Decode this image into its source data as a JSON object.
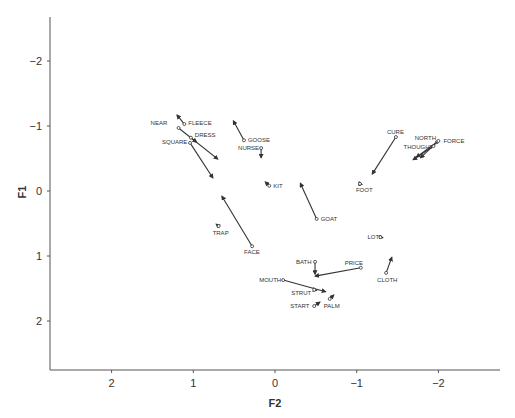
{
  "chart_data": {
    "type": "scatter",
    "subtype": "arrow-vector-plot",
    "title": "",
    "xlabel": "F2",
    "ylabel": "F1",
    "xlim": [
      2.75,
      -2.75
    ],
    "ylim": [
      -2.7,
      2.75
    ],
    "x_reversed": true,
    "y_reversed": true,
    "xticks": [
      2,
      1,
      0,
      -1,
      -2
    ],
    "yticks": [
      -2,
      -1,
      0,
      1,
      2
    ],
    "grid": false,
    "legend": null,
    "series": [
      {
        "name": "FLEECE",
        "start": [
          1.11,
          -1.03
        ],
        "end": [
          1.2,
          -1.17
        ],
        "label_dx": 4,
        "label_dy": 1,
        "anchor": "start"
      },
      {
        "name": "NEAR",
        "start": [
          1.18,
          -0.97
        ],
        "end": [
          0.7,
          -0.49
        ],
        "label_dx": -28,
        "label_dy": -3,
        "anchor": "start"
      },
      {
        "name": "DRESS",
        "start": [
          1.03,
          -0.82
        ],
        "end": [
          0.96,
          -0.75
        ],
        "label_dx": 4,
        "label_dy": -1,
        "anchor": "start"
      },
      {
        "name": "SQUARE",
        "start": [
          1.04,
          -0.74
        ],
        "end": [
          0.76,
          -0.2
        ],
        "label_dx": -28,
        "label_dy": 1,
        "anchor": "start"
      },
      {
        "name": "GOOSE",
        "start": [
          0.38,
          -0.78
        ],
        "end": [
          0.51,
          -1.08
        ],
        "label_dx": 4,
        "label_dy": 2,
        "anchor": "start"
      },
      {
        "name": "NURSE",
        "start": [
          0.17,
          -0.66
        ],
        "end": [
          0.17,
          -0.51
        ],
        "label_dx": -23,
        "label_dy": 2,
        "anchor": "start"
      },
      {
        "name": "KIT",
        "start": [
          0.07,
          -0.08
        ],
        "end": [
          0.12,
          -0.14
        ],
        "label_dx": 4,
        "label_dy": 2,
        "anchor": "start"
      },
      {
        "name": "GOAT",
        "start": [
          -0.51,
          0.43
        ],
        "end": [
          -0.31,
          -0.12
        ],
        "label_dx": 4,
        "label_dy": 2,
        "anchor": "start"
      },
      {
        "name": "FOOT",
        "start": [
          -1.04,
          -0.11
        ],
        "end": [
          -1.03,
          -0.14
        ],
        "label_dx": -4,
        "label_dy": 8,
        "anchor": "start"
      },
      {
        "name": "CURE",
        "start": [
          -1.48,
          -0.83
        ],
        "end": [
          -1.19,
          -0.26
        ],
        "label_dx": -9,
        "label_dy": -3,
        "anchor": "start"
      },
      {
        "name": "NORTH",
        "start": [
          -1.98,
          -0.75
        ],
        "end": [
          -1.73,
          -0.52
        ],
        "label_dx": -22,
        "label_dy": -2,
        "anchor": "start"
      },
      {
        "name": "FORCE",
        "start": [
          -2.0,
          -0.77
        ],
        "end": [
          -1.78,
          -0.51
        ],
        "label_dx": 5,
        "label_dy": 2,
        "anchor": "start"
      },
      {
        "name": "THOUGHT",
        "start": [
          -1.94,
          -0.69
        ],
        "end": [
          -1.69,
          -0.48
        ],
        "label_dx": -30,
        "label_dy": 3,
        "anchor": "start"
      },
      {
        "name": "TRAP",
        "start": [
          0.69,
          0.54
        ],
        "end": [
          0.72,
          0.51
        ],
        "label_dx": -6,
        "label_dy": 9,
        "anchor": "start"
      },
      {
        "name": "FACE",
        "start": [
          0.28,
          0.85
        ],
        "end": [
          0.65,
          0.08
        ],
        "label_dx": -8,
        "label_dy": 8,
        "anchor": "start"
      },
      {
        "name": "LOT",
        "start": [
          -1.29,
          0.71
        ],
        "end": [
          -1.32,
          0.72
        ],
        "label_dx": -13,
        "label_dy": 2,
        "anchor": "start"
      },
      {
        "name": "CLOTH",
        "start": [
          -1.36,
          1.26
        ],
        "end": [
          -1.43,
          1.02
        ],
        "label_dx": -9,
        "label_dy": 9,
        "anchor": "start"
      },
      {
        "name": "BATH",
        "start": [
          -0.49,
          1.09
        ],
        "end": [
          -0.49,
          1.28
        ],
        "label_dx": -19,
        "label_dy": 2,
        "anchor": "start"
      },
      {
        "name": "PRICE",
        "start": [
          -1.05,
          1.18
        ],
        "end": [
          -0.49,
          1.31
        ],
        "label_dx": -16,
        "label_dy": -3,
        "anchor": "start"
      },
      {
        "name": "MOUTH",
        "start": [
          -0.1,
          1.37
        ],
        "end": [
          -0.62,
          1.55
        ],
        "label_dx": -24,
        "label_dy": 2,
        "anchor": "start"
      },
      {
        "name": "STRUT",
        "start": [
          -0.48,
          1.52
        ],
        "end": [
          -0.51,
          1.53
        ],
        "label_dx": -23,
        "label_dy": 5,
        "anchor": "start"
      },
      {
        "name": "START",
        "start": [
          -0.48,
          1.77
        ],
        "end": [
          -0.55,
          1.71
        ],
        "label_dx": -24,
        "label_dy": 2,
        "anchor": "start"
      },
      {
        "name": "PALM",
        "start": [
          -0.67,
          1.66
        ],
        "end": [
          -0.72,
          1.6
        ],
        "label_dx": -6,
        "label_dy": 9,
        "anchor": "start"
      }
    ]
  },
  "axes": {
    "x_title": "F2",
    "y_title": "F1",
    "x_tick_labels": [
      "2",
      "1",
      "0",
      "−1",
      "−2"
    ],
    "y_tick_labels": [
      "−2",
      "−1",
      "0",
      "1",
      "2"
    ]
  }
}
